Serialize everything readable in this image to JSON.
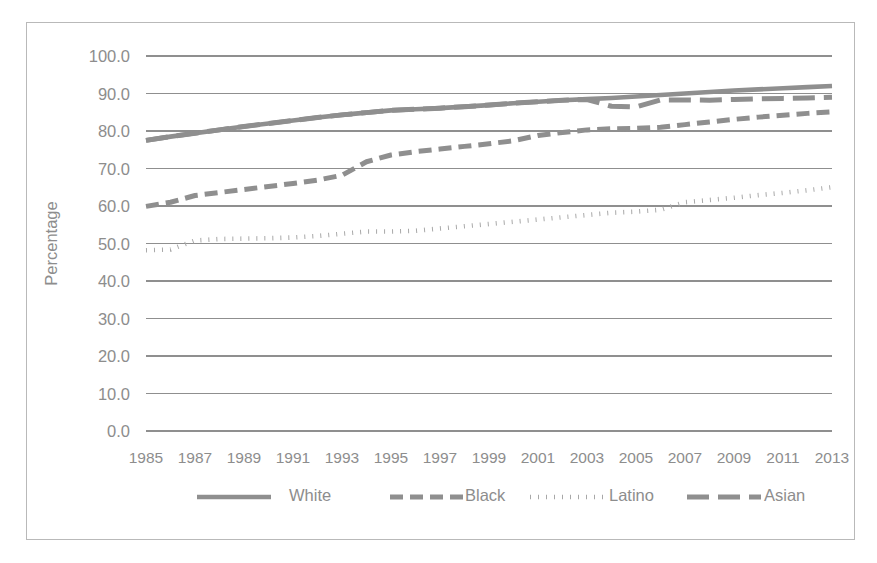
{
  "chart_data": {
    "type": "line",
    "title": "",
    "xlabel": "",
    "ylabel": "Percentage",
    "ylim": [
      0,
      100
    ],
    "ytick_step": 10,
    "grid": true,
    "legend_position": "bottom",
    "yticks": [
      "100.0",
      "90.0",
      "80.0",
      "70.0",
      "60.0",
      "50.0",
      "40.0",
      "30.0",
      "20.0",
      "10.0",
      "0.0"
    ],
    "x": [
      1985,
      1986,
      1987,
      1988,
      1989,
      1990,
      1991,
      1992,
      1993,
      1994,
      1995,
      1996,
      1997,
      1998,
      1999,
      2000,
      2001,
      2002,
      2003,
      2004,
      2005,
      2006,
      2007,
      2008,
      2009,
      2010,
      2011,
      2012,
      2013
    ],
    "xticks": [
      "1985",
      "1987",
      "1989",
      "1991",
      "1993",
      "1995",
      "1997",
      "1999",
      "2001",
      "2003",
      "2005",
      "2007",
      "2009",
      "2011",
      "2013"
    ],
    "xtick_values": [
      1985,
      1987,
      1989,
      1991,
      1993,
      1995,
      1997,
      1999,
      2001,
      2003,
      2005,
      2007,
      2009,
      2011,
      2013
    ],
    "series": [
      {
        "name": "White",
        "style": "solid",
        "color": "#8f8f8f",
        "values": [
          77.5,
          78.5,
          79.4,
          80.3,
          81.2,
          82.0,
          82.8,
          83.6,
          84.3,
          84.9,
          85.5,
          85.8,
          86.1,
          86.5,
          86.9,
          87.4,
          87.8,
          88.2,
          88.5,
          88.8,
          89.2,
          89.6,
          90.0,
          90.4,
          90.8,
          91.1,
          91.4,
          91.7,
          92.0
        ]
      },
      {
        "name": "Black",
        "style": "dashed",
        "color": "#8f8f8f",
        "values": [
          59.9,
          61.0,
          62.8,
          63.6,
          64.4,
          65.2,
          66.0,
          66.9,
          68.2,
          71.8,
          73.6,
          74.5,
          75.2,
          75.9,
          76.6,
          77.4,
          78.8,
          79.6,
          80.3,
          80.6,
          80.7,
          81.0,
          81.7,
          82.4,
          83.1,
          83.7,
          84.2,
          84.7,
          85.1
        ]
      },
      {
        "name": "Latino",
        "style": "dotted",
        "color": "#a8a8a8",
        "values": [
          48.2,
          48.4,
          50.8,
          51.2,
          51.3,
          51.4,
          51.6,
          52.0,
          52.6,
          53.2,
          53.2,
          53.4,
          54.0,
          54.6,
          55.2,
          55.8,
          56.4,
          57.0,
          57.6,
          58.2,
          58.5,
          59.0,
          61.0,
          61.6,
          62.2,
          62.9,
          63.5,
          64.2,
          65.0
        ]
      },
      {
        "name": "Asian",
        "style": "longdash",
        "color": "#8f8f8f",
        "values": [
          77.5,
          78.5,
          79.4,
          80.3,
          81.2,
          82.0,
          82.8,
          83.6,
          84.3,
          84.9,
          85.5,
          85.8,
          86.1,
          86.5,
          86.9,
          87.4,
          87.8,
          88.2,
          88.4,
          86.6,
          86.4,
          88.3,
          88.3,
          88.2,
          88.4,
          88.6,
          88.7,
          88.8,
          89.0
        ]
      }
    ],
    "legend": [
      {
        "label": "White",
        "style": "solid"
      },
      {
        "label": "Black",
        "style": "dashed"
      },
      {
        "label": "Latino",
        "style": "dotted"
      },
      {
        "label": "Asian",
        "style": "longdash"
      }
    ]
  }
}
